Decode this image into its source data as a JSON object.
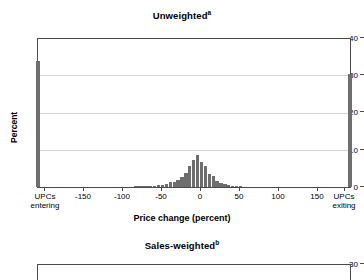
{
  "chart_data": [
    {
      "type": "bar",
      "title": "Unweighted",
      "title_superscript": "a",
      "xlabel": "Price change (percent)",
      "ylabel": "Percent",
      "ylim": [
        0,
        40
      ],
      "yticks": [
        0,
        10,
        20,
        30,
        40
      ],
      "ytick_labels": [
        "0",
        "10",
        "20",
        "30",
        "40"
      ],
      "xlim": [
        -200,
        200
      ],
      "xticks": [
        -200,
        -150,
        -100,
        -50,
        0,
        50,
        100,
        150,
        200
      ],
      "xtick_labels": [
        "UPCs entering",
        "-150",
        "-100",
        "-50",
        "0",
        "50",
        "100",
        "150",
        "UPCs exiting"
      ],
      "grid": true,
      "bar_color": "#6e6e6e",
      "categories": [
        -200,
        -75,
        -70,
        -65,
        -60,
        -55,
        -50,
        -45,
        -40,
        -35,
        -30,
        -25,
        -20,
        -15,
        -10,
        -5,
        0,
        5,
        10,
        15,
        20,
        25,
        30,
        35,
        40,
        45,
        50,
        55,
        60,
        200
      ],
      "values": [
        34.0,
        0.15,
        0.2,
        0.2,
        0.25,
        0.3,
        0.4,
        0.5,
        0.6,
        0.9,
        1.3,
        1.3,
        1.9,
        2.6,
        3.8,
        5.6,
        7.4,
        8.7,
        6.8,
        5.6,
        3.4,
        3.0,
        1.7,
        1.0,
        0.9,
        0.5,
        0.35,
        0.25,
        0.15,
        30.5
      ],
      "annotations": [
        {
          "x": -200,
          "label": "UPCs entering",
          "value": 34.0
        },
        {
          "x": 200,
          "label": "UPCs exiting",
          "value": 30.5
        }
      ]
    },
    {
      "type": "bar",
      "title": "Sales-weighted",
      "title_superscript": "b",
      "ylim": [
        0,
        30
      ],
      "yticks": [
        30
      ],
      "ytick_labels": [
        "30"
      ],
      "grid": true,
      "bar_color": "#6e6e6e",
      "categories": [],
      "values": [],
      "note": "panel truncated at bottom edge of screenshot"
    }
  ],
  "panels": {
    "top": {
      "title": "Unweighted",
      "title_sup": "a",
      "ylabel": "Percent",
      "xlabel": "Price change (percent)",
      "yticks": [
        {
          "label": "40"
        },
        {
          "label": "30"
        },
        {
          "label": "20"
        },
        {
          "label": "10"
        },
        {
          "label": "0"
        }
      ],
      "xticks": [
        {
          "line1": "UPCs",
          "line2": "entering"
        },
        {
          "line1": "-150",
          "line2": ""
        },
        {
          "line1": "-100",
          "line2": ""
        },
        {
          "line1": "-50",
          "line2": ""
        },
        {
          "line1": "0",
          "line2": ""
        },
        {
          "line1": "50",
          "line2": ""
        },
        {
          "line1": "100",
          "line2": ""
        },
        {
          "line1": "150",
          "line2": ""
        },
        {
          "line1": "UPCs",
          "line2": "exiting"
        }
      ]
    },
    "bottom": {
      "title": "Sales-weighted",
      "title_sup": "b",
      "yticks": [
        {
          "label": "30"
        }
      ]
    }
  }
}
